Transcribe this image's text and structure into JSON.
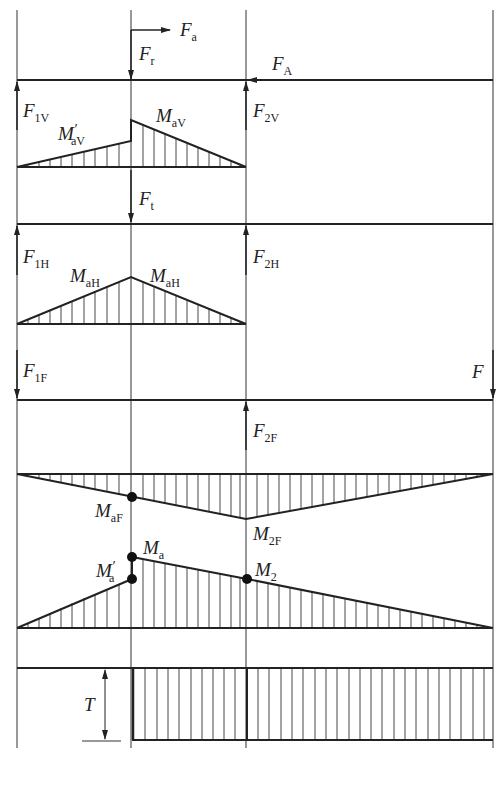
{
  "diagram": {
    "type": "shaft force and bending/torque moment diagrams",
    "colors": {
      "line": "#222222",
      "background": "#ffffff"
    },
    "columns_x": {
      "left_bearing_1": 17,
      "gear_a": 131,
      "right_bearing_2": 246,
      "shaft_end": 493
    },
    "panels": [
      {
        "id": "vertical-plane-forces",
        "forces": [
          {
            "label": "F",
            "sub": "a",
            "dir": "right"
          },
          {
            "label": "F",
            "sub": "r",
            "dir": "down"
          },
          {
            "label": "F",
            "sub": "A",
            "dir": "left"
          },
          {
            "label": "F",
            "sub": "1V",
            "dir": "up"
          },
          {
            "label": "F",
            "sub": "2V",
            "dir": "up"
          }
        ]
      },
      {
        "id": "vertical-plane-moment",
        "labels": [
          {
            "label": "M",
            "sub": "aV",
            "prime": true
          },
          {
            "label": "M",
            "sub": "aV",
            "prime": false
          }
        ]
      },
      {
        "id": "horizontal-plane-forces",
        "forces": [
          {
            "label": "F",
            "sub": "t",
            "dir": "down"
          },
          {
            "label": "F",
            "sub": "1H",
            "dir": "up"
          },
          {
            "label": "F",
            "sub": "2H",
            "dir": "up"
          }
        ]
      },
      {
        "id": "horizontal-plane-moment",
        "labels": [
          {
            "label": "M",
            "sub": "aH"
          },
          {
            "label": "M",
            "sub": "aH"
          }
        ]
      },
      {
        "id": "external-force-plane",
        "forces": [
          {
            "label": "F",
            "sub": "1F",
            "dir": "down"
          },
          {
            "label": "F",
            "sub": "",
            "dir": "down"
          },
          {
            "label": "F",
            "sub": "2F",
            "dir": "up"
          }
        ]
      },
      {
        "id": "external-force-moment",
        "labels": [
          {
            "label": "M",
            "sub": "aF"
          },
          {
            "label": "M",
            "sub": "2F"
          }
        ]
      },
      {
        "id": "combined-moment",
        "labels": [
          {
            "label": "M",
            "sub": "a"
          },
          {
            "label": "M",
            "sub": "a",
            "prime": true
          },
          {
            "label": "M",
            "sub": "2"
          }
        ]
      },
      {
        "id": "torque",
        "labels": [
          {
            "label": "T"
          }
        ]
      }
    ]
  },
  "text": {
    "Fa": "F",
    "Fa_sub": "a",
    "Fr": "F",
    "Fr_sub": "r",
    "FA": "F",
    "FA_sub": "A",
    "F1V": "F",
    "F1V_sub": "1V",
    "F2V": "F",
    "F2V_sub": "2V",
    "MaV_p": "M",
    "MaV_p_sub": "aV",
    "prime": "′",
    "MaV": "M",
    "MaV_sub": "aV",
    "Ft": "F",
    "Ft_sub": "t",
    "F1H": "F",
    "F1H_sub": "1H",
    "F2H": "F",
    "F2H_sub": "2H",
    "MaH1": "M",
    "MaH1_sub": "aH",
    "MaH2": "M",
    "MaH2_sub": "aH",
    "F1F": "F",
    "F1F_sub": "1F",
    "F": "F",
    "F2F": "F",
    "F2F_sub": "2F",
    "MaF": "M",
    "MaF_sub": "aF",
    "M2F": "M",
    "M2F_sub": "2F",
    "Ma": "M",
    "Ma_sub": "a",
    "Ma_p": "M",
    "Ma_p_sub": "a",
    "M2": "M",
    "M2_sub": "2",
    "T": "T"
  }
}
